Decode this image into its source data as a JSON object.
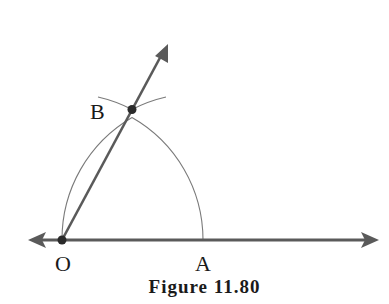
{
  "figure": {
    "caption": "Figure 11.80",
    "type": "geometric construction",
    "points": [
      {
        "id": "O",
        "label": "O",
        "x": 62,
        "y": 240
      },
      {
        "id": "A",
        "label": "A",
        "x": 203,
        "y": 240
      },
      {
        "id": "B",
        "label": "B",
        "x": 132,
        "y": 110
      }
    ],
    "lines": [
      {
        "id": "line-OA",
        "description": "horizontal line through O and A, arrows both ends"
      },
      {
        "id": "ray-OB",
        "description": "ray from O through B with arrowhead"
      }
    ],
    "arcs": [
      {
        "id": "arc-center-O",
        "center": "O",
        "through": [
          "A",
          "B"
        ]
      },
      {
        "id": "arc-center-A",
        "center": "A",
        "through": [
          "O",
          "B"
        ]
      }
    ],
    "colors": {
      "line": "#5a5a5a",
      "arc": "#7a7a7a",
      "point": "#2a2a2a",
      "text": "#1a1a1a"
    }
  }
}
